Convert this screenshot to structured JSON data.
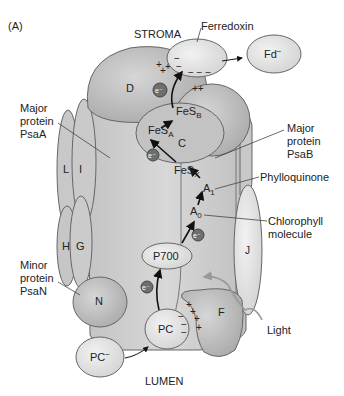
{
  "panel_label": "(A)",
  "regions": {
    "stroma": "STROMA",
    "lumen": "LUMEN"
  },
  "callouts": {
    "ferredoxin": "Ferredoxin",
    "major_psaa": [
      "Major",
      "protein",
      "PsaA"
    ],
    "major_psab": [
      "Major",
      "protein",
      "PsaB"
    ],
    "phylloquinone": "Phylloquinone",
    "chlorophyll": [
      "Chlorophyll",
      "molecule"
    ],
    "minor_psan": [
      "Minor",
      "protein",
      "PsaN"
    ],
    "light": "Light"
  },
  "subunits": {
    "D": "D",
    "E": "E",
    "C": "C",
    "K": "K",
    "L": "L",
    "I": "I",
    "H": "H",
    "G": "G",
    "J": "J",
    "N": "N",
    "F": "F"
  },
  "carriers": {
    "fd_reduced": "Fd",
    "fd_sup": "−",
    "fesa": "FeS",
    "fesa_sub": "A",
    "fesb": "FeS",
    "fesb_sub": "B",
    "fesx": "FeS",
    "fesx_sub": "X",
    "a1": "A",
    "a1_sub": "1",
    "a0": "A",
    "a0_sub": "0",
    "p700": "P700",
    "pc": "PC",
    "pc_reduced": "PC",
    "pc_sup": "−",
    "electron": "e⁻"
  },
  "colors": {
    "complex_fill": "#cfcfcf",
    "subunit_fill": "#bdbdbd",
    "light_fill": "#e6e6e6",
    "electron_fill": "#6e6e6e",
    "stroke": "#555555",
    "light_path": "#9a9a9a"
  }
}
